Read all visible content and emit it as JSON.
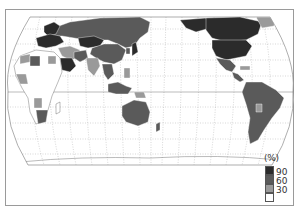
{
  "map": {
    "type": "choropleth",
    "projection": "pseudo-cylindrical (Robinson-like), Pacific-centered",
    "classes": [
      {
        "range": "90–100",
        "color": "#2b2b2b"
      },
      {
        "range": "60–90",
        "color": "#5a5a5a"
      },
      {
        "range": "30–60",
        "color": "#9a9a9a"
      },
      {
        "range": "0–30",
        "color": "#ffffff"
      }
    ]
  },
  "legend": {
    "title": "(%)",
    "ticks": [
      "90",
      "60",
      "30"
    ],
    "colors": {
      "c90": "#2b2b2b",
      "c60": "#5a5a5a",
      "c30": "#9a9a9a",
      "c0": "#ffffff"
    }
  }
}
